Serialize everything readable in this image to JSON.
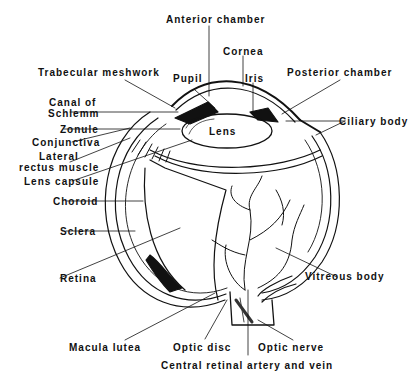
{
  "diagram": {
    "colors": {
      "ink": "#111111",
      "background": "#ffffff"
    },
    "labels": {
      "anterior_chamber": "Anterior chamber",
      "cornea": "Cornea",
      "trabecular_meshwork": "Trabecular meshwork",
      "pupil": "Pupil",
      "iris": "Iris",
      "posterior_chamber": "Posterior chamber",
      "canal_of_schlemm_1": "Canal of",
      "canal_of_schlemm_2": "Schlemm",
      "ciliary_body": "Ciliary body",
      "zonule": "Zonule",
      "lens": "Lens",
      "conjunctiva": "Conjunctiva",
      "lateral_rectus_1": "Lateral",
      "lateral_rectus_2": "rectus muscle",
      "lens_capsule": "Lens capsule",
      "choroid": "Choroid",
      "sclera": "Sclera",
      "retina": "Retina",
      "vitreous_body": "Vitreous body",
      "macula_lutea": "Macula lutea",
      "optic_disc": "Optic disc",
      "optic_nerve": "Optic nerve",
      "central_retinal": "Central retinal artery and vein"
    }
  }
}
